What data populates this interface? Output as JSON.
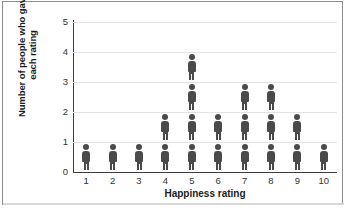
{
  "chart_data": {
    "type": "bar",
    "subtype": "pictogram-dot-plot",
    "title": "",
    "subtitle": "",
    "xlabel": "Happiness rating",
    "ylabel": "Number of people who gave each rating",
    "ylabel_lines": [
      "Number of people who gave",
      "each rating"
    ],
    "categories": [
      "1",
      "2",
      "3",
      "4",
      "5",
      "6",
      "7",
      "8",
      "9",
      "10"
    ],
    "values": [
      1,
      1,
      1,
      2,
      4,
      2,
      3,
      3,
      2,
      1
    ],
    "yticks": [
      "0",
      "1",
      "2",
      "3",
      "4",
      "5"
    ],
    "ylim": [
      0,
      5
    ],
    "xlim": [
      0.5,
      10.5
    ],
    "grid": true,
    "legend": null,
    "annotations": [],
    "marker": "person-figure",
    "marker_color": "#4a4a4a",
    "grid_color": "#e2e2e2",
    "axis_color": "#3d3d3d",
    "background": "#ffffff"
  }
}
